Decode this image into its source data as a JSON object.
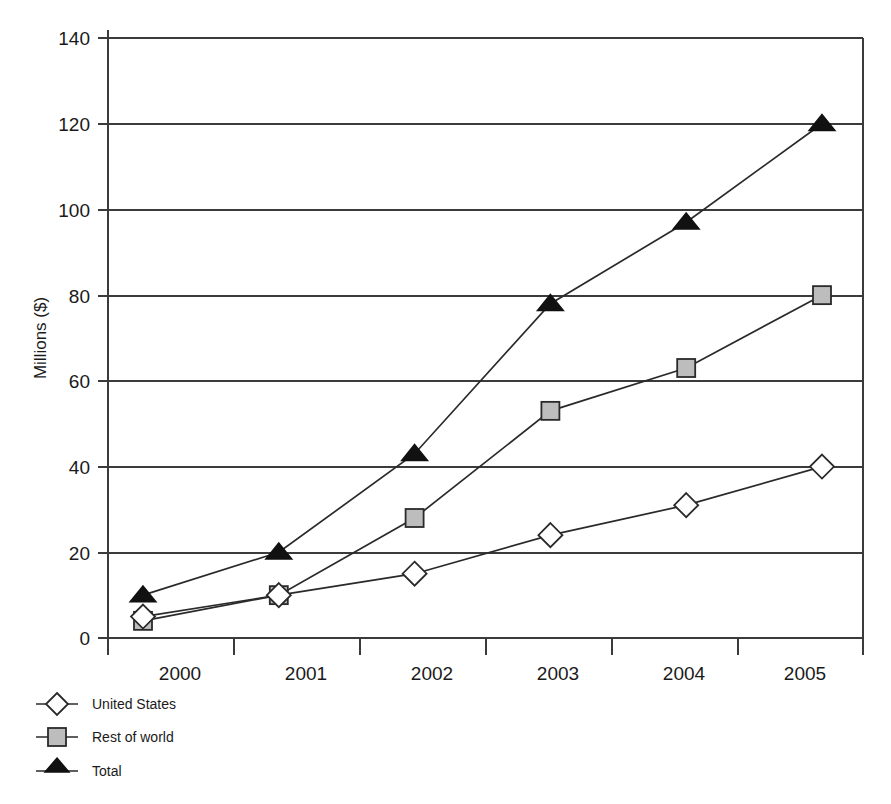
{
  "chart_data": {
    "type": "line",
    "title": "",
    "xlabel": "",
    "ylabel": "Millions ($)",
    "categories": [
      "2000",
      "2001",
      "2002",
      "2003",
      "2004",
      "2005"
    ],
    "series": [
      {
        "name": "United States",
        "marker": "diamond-open",
        "values": [
          5,
          10,
          15,
          24,
          31,
          40
        ]
      },
      {
        "name": "Rest of world",
        "marker": "square-gray",
        "values": [
          4,
          10,
          28,
          53,
          63,
          80
        ]
      },
      {
        "name": "Total",
        "marker": "triangle-filled",
        "values": [
          10,
          20,
          43,
          78,
          97,
          120
        ]
      }
    ],
    "yticks": [
      0,
      20,
      40,
      60,
      80,
      100,
      120,
      140
    ],
    "ylim": [
      0,
      140
    ],
    "grid": "horizontal",
    "legend_position": "bottom-left",
    "colors": {
      "line": "#2a2a2a",
      "axis": "#3b3b3b",
      "united_states_marker_fill": "#ffffff",
      "rest_of_world_marker_fill": "#bdbdbd",
      "total_marker_fill": "#111111"
    }
  },
  "axis": {
    "y_title": "Millions ($)",
    "y_tick_labels": [
      "140",
      "120",
      "100",
      "80",
      "60",
      "40",
      "20",
      "0"
    ],
    "x_tick_labels": [
      "2000",
      "2001",
      "2002",
      "2003",
      "2004",
      "2005"
    ]
  },
  "legend": {
    "items": [
      {
        "label": "United States",
        "marker": "diamond-open"
      },
      {
        "label": "Rest of world",
        "marker": "square-gray"
      },
      {
        "label": "Total",
        "marker": "triangle-filled"
      }
    ]
  }
}
